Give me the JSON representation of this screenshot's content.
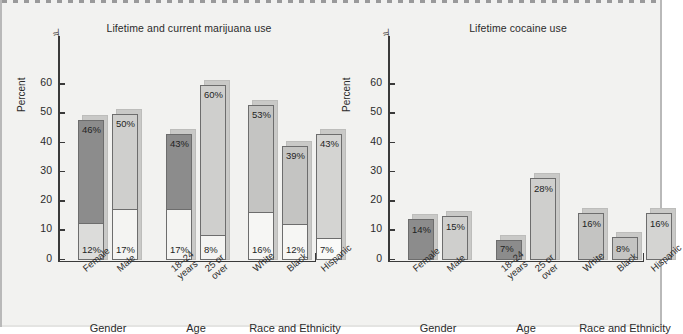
{
  "figure": {
    "background": "#f2f2f0",
    "axis_color": "#3a3a3a"
  },
  "chart_data": [
    {
      "type": "bar",
      "subtype": "stacked-bar",
      "title": "Lifetime and current marijuana use",
      "xlabel": "",
      "ylabel": "Percent",
      "ylim": [
        0,
        65
      ],
      "yticks": [
        0,
        10,
        20,
        30,
        40,
        50,
        60
      ],
      "ytick_labels": [
        "0",
        "10",
        "20",
        "30",
        "40",
        "50",
        "60"
      ],
      "axis_break": true,
      "grid": false,
      "legend": "none",
      "groups": [
        {
          "name": "Gender",
          "categories": [
            "Female",
            "Male"
          ],
          "bars": [
            {
              "label": "Female",
              "lifetime": 46,
              "current": 12,
              "lifetime_label": "46%",
              "current_label": "12%",
              "total_height": 48,
              "color": "#8c8c8c",
              "bottom_color": "#dcdcda"
            },
            {
              "label": "Male",
              "lifetime": 50,
              "current": 17,
              "lifetime_label": "50%",
              "current_label": "17%",
              "total_height": 50,
              "color": "#cfcfcd",
              "bottom_color": "#f4f4f2"
            }
          ]
        },
        {
          "name": "Age",
          "categories": [
            "18–24\nyears",
            "25 or\nover"
          ],
          "bars": [
            {
              "label": "18–24 years",
              "lifetime": 43,
              "current": 17,
              "lifetime_label": "43%",
              "current_label": "17%",
              "total_height": 43,
              "color": "#8c8c8c",
              "bottom_color": "#f4f4f2"
            },
            {
              "label": "25 or over",
              "lifetime": 60,
              "current": 8,
              "lifetime_label": "60%",
              "current_label": "8%",
              "total_height": 60,
              "color": "#cfcfcd",
              "bottom_color": "#f4f4f2"
            }
          ]
        },
        {
          "name": "Race and Ethnicity",
          "categories": [
            "White",
            "Black",
            "Hispanic"
          ],
          "bars": [
            {
              "label": "White",
              "lifetime": 53,
              "current": 16,
              "lifetime_label": "53%",
              "current_label": "16%",
              "total_height": 53,
              "color": "#c4c4c2",
              "bottom_color": "#f6f6f4"
            },
            {
              "label": "Black",
              "lifetime": 39,
              "current": 12,
              "lifetime_label": "39%",
              "current_label": "12%",
              "total_height": 39,
              "color": "#c4c4c2",
              "bottom_color": "#f6f6f4"
            },
            {
              "label": "Hispanic",
              "lifetime": 43,
              "current": 7,
              "lifetime_label": "43%",
              "current_label": "7%",
              "total_height": 43,
              "color": "#d4d4d2",
              "bottom_color": "#fafaf8"
            }
          ]
        }
      ]
    },
    {
      "type": "bar",
      "subtype": "bar",
      "title": "Lifetime cocaine use",
      "xlabel": "",
      "ylabel": "Percent",
      "ylim": [
        0,
        65
      ],
      "yticks": [
        0,
        10,
        20,
        30,
        40,
        50,
        60
      ],
      "ytick_labels": [
        "0",
        "10",
        "20",
        "30",
        "40",
        "50",
        "60"
      ],
      "axis_break": true,
      "grid": false,
      "legend": "none",
      "groups": [
        {
          "name": "Gender",
          "categories": [
            "Female",
            "Male"
          ],
          "bars": [
            {
              "label": "Female",
              "value": 14,
              "value_label": "14%",
              "color": "#8c8c8c"
            },
            {
              "label": "Male",
              "value": 15,
              "value_label": "15%",
              "color": "#cfcfcd"
            }
          ]
        },
        {
          "name": "Age",
          "categories": [
            "18–24\nyears",
            "25 or\nover"
          ],
          "bars": [
            {
              "label": "18–24 years",
              "value": 7,
              "value_label": "7%",
              "color": "#8c8c8c"
            },
            {
              "label": "25 or over",
              "value": 28,
              "value_label": "28%",
              "color": "#cfcfcd"
            }
          ]
        },
        {
          "name": "Race and Ethnicity",
          "categories": [
            "White",
            "Black",
            "Hispanic"
          ],
          "bars": [
            {
              "label": "White",
              "value": 16,
              "value_label": "16%",
              "color": "#c4c4c2"
            },
            {
              "label": "Black",
              "value": 8,
              "value_label": "8%",
              "color": "#c4c4c2"
            },
            {
              "label": "Hispanic",
              "value": 16,
              "value_label": "16%",
              "color": "#d4d4d2"
            }
          ]
        }
      ]
    }
  ]
}
